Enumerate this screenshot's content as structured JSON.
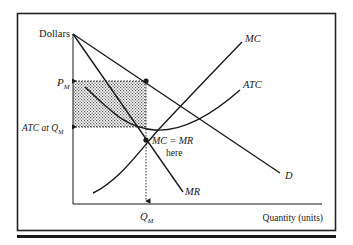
{
  "diagram": {
    "type": "monopoly-profit-maximization",
    "y_axis_label": "Dollars",
    "x_axis_label": "Quantity (units)",
    "curves": {
      "mc": "MC",
      "atc": "ATC",
      "d": "D",
      "mr": "MR"
    },
    "price_label": {
      "main": "P",
      "sub": "M"
    },
    "atc_label": {
      "prefix": "ATC at Q",
      "sub": "M"
    },
    "quantity_label": {
      "main": "Q",
      "sub": "M"
    },
    "annotation": {
      "line1": "MC = MR",
      "line2": "here"
    },
    "shaded_region": "profit",
    "colors": {
      "ink": "#1a1a1a",
      "frame": "#222222",
      "shade": "#9a9a9a",
      "background": "#ffffff"
    }
  }
}
